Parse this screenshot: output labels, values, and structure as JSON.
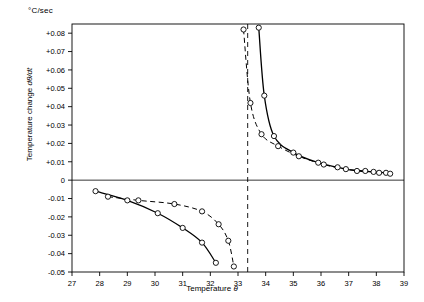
{
  "labels": {
    "unit": "°C/sec",
    "y_axis_title_plain": "Temperature change dθ/dt",
    "y_axis_title_pre": "Temperature change ",
    "y_axis_title_italic": "dθ/dt",
    "x_axis_title_pre": "Temperature ",
    "x_axis_title_italic": "θ"
  },
  "chart_data": {
    "type": "scatter",
    "title": "",
    "xlabel": "Temperature θ",
    "ylabel": "Temperature change dθ/dt",
    "unit": "°C/sec",
    "xlim": [
      27,
      39
    ],
    "ylim": [
      -0.05,
      0.085
    ],
    "grid": false,
    "legend": null,
    "xticks": [
      27,
      28,
      29,
      30,
      31,
      32,
      33,
      34,
      35,
      36,
      37,
      38,
      39
    ],
    "xticklabels": [
      "27",
      "28",
      "29",
      "30",
      "31",
      "32",
      "33",
      "34",
      "35",
      "36",
      "37",
      "38",
      "39"
    ],
    "yticks": [
      0.08,
      0.07,
      0.06,
      0.05,
      0.04,
      0.03,
      0.02,
      0.01,
      0,
      -0.01,
      -0.02,
      -0.03,
      -0.04,
      -0.05
    ],
    "yticklabels": [
      "+0.08",
      "+0.07",
      "+0.06",
      "+0.05",
      "+0.04",
      "+0.03",
      "+0.02",
      "+0.01",
      "0",
      "-0.01",
      "-0.02",
      "-0.03",
      "-0.04",
      "-0.05"
    ],
    "zero_line_y": 0,
    "asymptote_x": 33.35,
    "annotations": [
      {
        "type": "vertical-dashed-line",
        "x": 33.35,
        "label": ""
      }
    ],
    "series": [
      {
        "name": "solid-curve-lower-left",
        "style": "solid",
        "marker": "open-circle",
        "points": [
          {
            "x": 27.85,
            "y": -0.006
          },
          {
            "x": 29.0,
            "y": -0.011
          },
          {
            "x": 30.1,
            "y": -0.018
          },
          {
            "x": 31.0,
            "y": -0.026
          },
          {
            "x": 31.7,
            "y": -0.034
          },
          {
            "x": 32.2,
            "y": -0.045
          }
        ]
      },
      {
        "name": "dashed-curve-lower-left",
        "style": "dashed",
        "marker": "open-circle",
        "points": [
          {
            "x": 28.3,
            "y": -0.009
          },
          {
            "x": 29.4,
            "y": -0.011
          },
          {
            "x": 30.7,
            "y": -0.013
          },
          {
            "x": 31.7,
            "y": -0.017
          },
          {
            "x": 32.3,
            "y": -0.024
          },
          {
            "x": 32.65,
            "y": -0.033
          },
          {
            "x": 32.85,
            "y": -0.047
          }
        ]
      },
      {
        "name": "solid-curve-upper-right",
        "style": "solid",
        "marker": "open-circle",
        "points": [
          {
            "x": 33.75,
            "y": 0.083
          },
          {
            "x": 33.95,
            "y": 0.046
          },
          {
            "x": 34.3,
            "y": 0.024
          },
          {
            "x": 35.0,
            "y": 0.015
          },
          {
            "x": 35.9,
            "y": 0.0095
          },
          {
            "x": 36.6,
            "y": 0.007
          },
          {
            "x": 37.3,
            "y": 0.005
          },
          {
            "x": 37.9,
            "y": 0.0045
          },
          {
            "x": 38.35,
            "y": 0.004
          }
        ]
      },
      {
        "name": "dashed-curve-upper-right",
        "style": "dashed",
        "marker": "open-circle",
        "points": [
          {
            "x": 33.2,
            "y": 0.082
          },
          {
            "x": 33.45,
            "y": 0.042
          },
          {
            "x": 33.85,
            "y": 0.025
          },
          {
            "x": 34.45,
            "y": 0.0185
          },
          {
            "x": 35.2,
            "y": 0.013
          },
          {
            "x": 36.1,
            "y": 0.0085
          },
          {
            "x": 36.9,
            "y": 0.006
          },
          {
            "x": 37.6,
            "y": 0.005
          },
          {
            "x": 38.1,
            "y": 0.004
          },
          {
            "x": 38.5,
            "y": 0.0035
          }
        ]
      }
    ]
  }
}
